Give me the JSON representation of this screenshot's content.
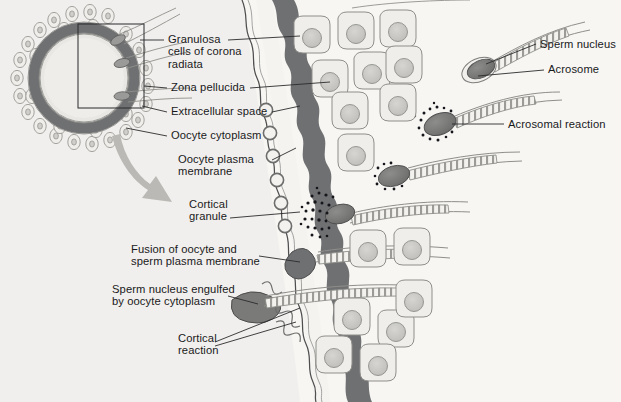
{
  "figure": {
    "background_color": "#f7f6f3",
    "ink_color": "#19191b",
    "zona_color": "#6f7072",
    "cytoplasm_color": "#e4e3df",
    "cell_fill_color": "#efeeea",
    "nucleus_color": "#c9c8c4",
    "arrow_color": "#b9b8b4"
  },
  "labels": [
    {
      "id": "granulosa",
      "text": "Granulosa\ncells of corona\nradiata",
      "x": 168,
      "y": 33,
      "align": "left"
    },
    {
      "id": "zona-pellucida",
      "text": "Zona pellucida",
      "x": 171,
      "y": 84,
      "align": "left"
    },
    {
      "id": "extracellular-space",
      "text": "Extracellular space",
      "x": 171,
      "y": 108,
      "align": "left"
    },
    {
      "id": "oocyte-cytoplasm",
      "text": "Oocyte cytoplasm",
      "x": 171,
      "y": 132,
      "align": "left"
    },
    {
      "id": "oocyte-plasma-membrane",
      "text": "Oocyte plasma\nmembrane",
      "x": 178,
      "y": 158,
      "align": "left"
    },
    {
      "id": "cortical-granule",
      "text": "Cortical\ngranule",
      "x": 189,
      "y": 198,
      "align": "left"
    },
    {
      "id": "fusion",
      "text": "Fusion of oocyte and\nsperm plasma membrane",
      "x": 131,
      "y": 243,
      "align": "left"
    },
    {
      "id": "sperm-engulfed",
      "text": "Sperm nucleus engulfed\nby oocyte cytoplasm",
      "x": 112,
      "y": 283,
      "align": "left"
    },
    {
      "id": "cortical-reaction",
      "text": "Cortical\nreaction",
      "x": 178,
      "y": 335,
      "align": "left"
    },
    {
      "id": "sperm-nucleus",
      "text": "Sperm nucleus",
      "x": 540,
      "y": 40,
      "align": "left"
    },
    {
      "id": "acrosome",
      "text": "Acrosome",
      "x": 548,
      "y": 65,
      "align": "left"
    },
    {
      "id": "acrosomal-reaction",
      "text": "Acrosomal reaction",
      "x": 508,
      "y": 120,
      "align": "left"
    }
  ],
  "structures": {
    "inset_oocyte": "circular oocyte with zona pellucida ring and corona radiata cells",
    "callout_box": "rectangle outlining magnified region of inset",
    "magnify_arrow": "curved grey arrow from inset to main figure",
    "zona_band": "thick dark grey wavy vertical band",
    "cortical_granules_count": 6,
    "corona_cells_count": 14,
    "sperm_count": 7
  }
}
